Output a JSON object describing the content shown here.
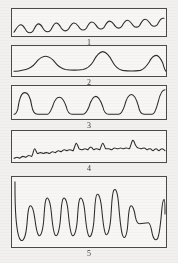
{
  "figure": {
    "type": "waveform-panel-stack",
    "panel_count": 5,
    "background_color": "#f1f0ee",
    "trace_color": "#2b2b2b",
    "border_color": "#4a4a4a"
  },
  "panels": [
    {
      "label": "1",
      "description": "regular low-amplitude sinusoidal oscillation on a slowly rising baseline",
      "geometry": {
        "x": 11,
        "y": 8,
        "w": 156,
        "h": 29
      },
      "path": "M2,25 C4,22 6,17 9,17 C12,17 13,22 15,24 C17,26 19,26 21,24 C23,21 24,16 27,16 C30,16 31,21 33,23 C35,25 37,25 39,23 C41,20 42,15 45,15 C48,15 49,20 51,22 C53,24 55,24 57,22 C59,19 60,15 63,15 C66,15 67,19 69,21 C71,23 73,23 75,21 C77,18 78,14 81,14 C84,14 85,18 87,20 C89,22 91,22 93,20 C95,17 96,13 99,13 C102,13 103,17 105,19 C107,21 109,21 111,19 C113,16 114,12 117,12 C120,12 121,16 123,18 C125,20 127,20 129,18 C131,15 132,11 135,11 C138,11 139,15 141,17 C143,19 145,19 147,17 C149,14 150,10 153,10 L154,10"
    },
    {
      "label": "2",
      "description": "three broad isolated peaks rising from a flat baseline, middle peak tallest",
      "geometry": {
        "x": 11,
        "y": 45,
        "w": 156,
        "h": 32
      },
      "path": "M2,27 C6,27 10,26 14,25 C18,24 21,22 24,18 C27,14 30,11 34,11 C38,11 41,14 44,18 C47,22 50,24 54,25 C60,26 66,26 72,25 C76,24 79,22 82,17 C85,11 88,6 92,6 C96,6 99,11 102,17 C105,23 108,25 112,26 C118,27 124,27 130,26 C133,25 136,22 139,17 C141,13 143,10 146,10 C149,10 151,14 153,19 C154,23 155,26 156,27"
    },
    {
      "label": "3",
      "description": "five sharp resolved peaks separated by flat valleys; first and fifth peaks tallest",
      "geometry": {
        "x": 11,
        "y": 85,
        "w": 156,
        "h": 35
      },
      "path": "M2,30 C4,30 5,28 6,24 C7,16 9,7 13,7 C17,7 19,14 20,21 C21,27 23,30 26,30 C30,30 33,30 36,30 C38,30 39,27 41,22 C43,15 45,12 48,12 C51,12 53,16 55,22 C56,27 58,30 61,30 C65,30 69,30 72,30 C74,30 76,27 78,22 C80,15 82,11 85,11 C88,11 90,16 92,22 C93,27 95,30 98,30 C102,30 105,30 108,30 C110,30 112,27 114,21 C116,13 118,9 121,9 C124,9 126,14 128,21 C129,27 131,30 134,30 C137,30 140,30 142,30 C144,30 146,25 148,17 C150,8 152,4 155,4"
    },
    {
      "label": "4",
      "description": "noisy irregular trace with many small jagged fluctuations and a few modest bumps",
      "geometry": {
        "x": 11,
        "y": 130,
        "w": 156,
        "h": 33
      },
      "path": "M2,29 C3,29 4,28 5,28 C6,28 7,29 8,29 C9,28 10,27 11,27 C12,27 13,28 14,28 C15,27 16,26 17,26 C18,26 19,27 20,27 C21,26 22,19 23,19 C24,19 25,24 26,24 C27,24 28,23 29,23 C30,23 31,24 32,24 C33,23 34,23 35,23 C36,23 37,24 38,24 C39,23 40,22 41,22 C42,22 43,23 44,23 C45,22 46,21 47,21 C48,21 49,22 50,22 C51,21 52,20 53,20 C54,20 55,21 56,21 C57,20 58,20 59,20 C60,20 61,21 62,21 C63,19 64,14 65,13 C66,13 67,17 68,19 C69,20 70,20 71,20 C72,20 73,19 74,19 C75,19 76,20 77,20 C78,18 79,17 80,17 C81,17 82,20 83,20 C84,19 85,19 86,19 C87,19 88,20 89,20 C90,18 91,13 92,13 C93,13 94,18 95,19 C96,19 97,19 98,19 C99,19 100,20 101,20 C102,19 103,18 104,18 C105,18 106,19 107,19 C108,19 109,18 110,18 C111,18 112,19 113,19 C114,18 115,18 116,18 C117,18 118,19 119,19 C120,17 121,12 122,10 C123,9 124,12 125,15 C126,17 127,18 128,18 C129,18 130,19 131,19 C132,18 133,18 134,18 C135,18 136,20 137,20 C138,19 139,19 140,19 C141,19 142,21 143,21 C144,20 145,19 146,19 C147,19 148,21 149,21 C150,20 151,19 152,19 C153,19 154,20 155,21"
    },
    {
      "label": "5",
      "description": "dense series of tall broad rounded-rectangular peaks of varying width nearly filling the frame",
      "geometry": {
        "x": 11,
        "y": 176,
        "w": 156,
        "h": 72
      },
      "path": "M3,5 C3,16 3,30 4,42 C5,54 6,63 9,65 C12,67 14,60 15,50 C16,40 16,32 18,30 C20,28 22,34 23,42 C24,50 25,58 27,60 C29,62 31,56 32,46 C33,34 33,24 35,22 C37,20 39,27 40,38 C41,49 42,58 44,60 C46,62 48,55 49,44 C50,33 50,24 52,22 C54,20 56,26 57,37 C58,48 59,58 61,60 C63,62 65,56 66,46 C67,34 67,24 69,22 C71,20 73,27 74,38 C75,49 76,58 78,61 C80,63 82,56 83,45 C84,32 84,20 86,18 C88,16 90,23 91,34 C92,45 93,56 95,59 C97,61 99,54 100,43 C101,31 101,18 103,14 C105,10 107,16 108,28 C109,40 110,54 112,60 C114,65 116,61 117,52 C118,42 118,32 120,30 C122,28 124,34 125,41 C126,46 127,48 129,48 C132,48 135,47 138,47 C140,47 141,52 142,58 C143,63 145,66 147,64 C149,62 150,52 151,42 C152,32 152,24 154,23 C155,23 155,30 155,38"
    }
  ]
}
